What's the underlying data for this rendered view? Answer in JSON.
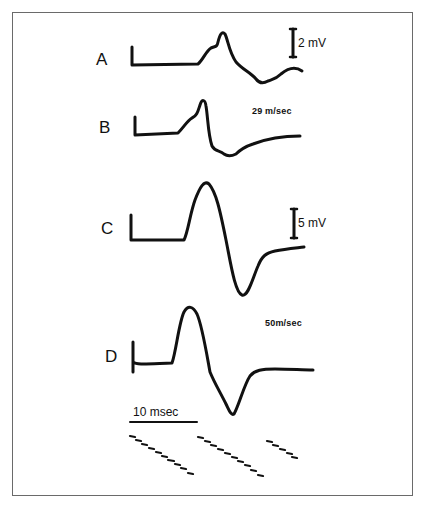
{
  "figure": {
    "traces": [
      {
        "id": "A",
        "label": "A",
        "scale_label": "2 mV",
        "speed_label": null
      },
      {
        "id": "B",
        "label": "B",
        "scale_label": null,
        "speed_label": "29 m/sec"
      },
      {
        "id": "C",
        "label": "C",
        "scale_label": "5 mV",
        "speed_label": null
      },
      {
        "id": "D",
        "label": "D",
        "scale_label": null,
        "speed_label": "50m/sec"
      }
    ],
    "time_scale_label": "10 msec",
    "colors": {
      "ink": "#111111",
      "border": "#6a6a6a",
      "background": "#ffffff"
    }
  }
}
